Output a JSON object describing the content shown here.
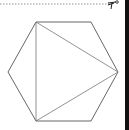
{
  "figure": {
    "stroke_color": "#555555",
    "cut_line_color": "#777777",
    "edge_bar_color": "#111111",
    "hexagon": {
      "vertices": [
        [
          36,
          22
        ],
        [
          91,
          22
        ],
        [
          118,
          72
        ],
        [
          91,
          121
        ],
        [
          36,
          121
        ],
        [
          8,
          72
        ]
      ]
    },
    "triangle": {
      "vertices": [
        [
          36,
          22
        ],
        [
          118,
          72
        ],
        [
          36,
          121
        ]
      ]
    },
    "cut_line": {
      "y": 4,
      "x_start": 0,
      "x_end": 110,
      "icon": "scissors-icon"
    }
  }
}
